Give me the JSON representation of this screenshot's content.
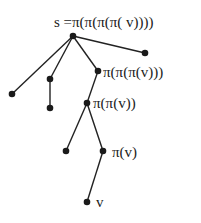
{
  "diagram": {
    "type": "tree",
    "nodes": [
      {
        "id": "root",
        "x": 73,
        "y": 36,
        "label": "s =π(π(π(π( v))))"
      },
      {
        "id": "r_leaf",
        "x": 145,
        "y": 53,
        "label": ""
      },
      {
        "id": "l_leaf",
        "x": 12,
        "y": 94,
        "label": ""
      },
      {
        "id": "m_node",
        "x": 50,
        "y": 79,
        "label": ""
      },
      {
        "id": "m_leaf",
        "x": 50,
        "y": 108,
        "label": ""
      },
      {
        "id": "p3",
        "x": 98,
        "y": 71,
        "label": "π(π(π(v)))"
      },
      {
        "id": "p2",
        "x": 87,
        "y": 103,
        "label": "π(π(v))"
      },
      {
        "id": "p2_leaf",
        "x": 66,
        "y": 151,
        "label": ""
      },
      {
        "id": "p1",
        "x": 103,
        "y": 151,
        "label": "π(v)"
      },
      {
        "id": "v",
        "x": 87,
        "y": 202,
        "label": "v"
      }
    ],
    "edges": [
      [
        "root",
        "r_leaf"
      ],
      [
        "root",
        "l_leaf"
      ],
      [
        "root",
        "m_node"
      ],
      [
        "root",
        "p3"
      ],
      [
        "m_node",
        "m_leaf"
      ],
      [
        "p3",
        "p2"
      ],
      [
        "p2",
        "p2_leaf"
      ],
      [
        "p2",
        "p1"
      ],
      [
        "p1",
        "v"
      ]
    ],
    "labels": {
      "root": "s =π(π(π(π( v))))",
      "p3": "π(π(π(v)))",
      "p2": "π(π(v))",
      "p1": "π(v)",
      "v": "v"
    }
  }
}
